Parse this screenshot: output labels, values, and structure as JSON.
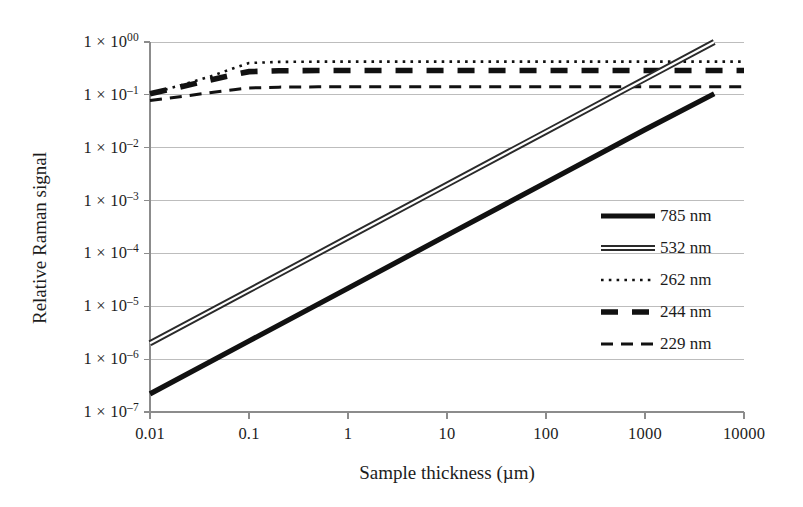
{
  "figure": {
    "background_color": "#ffffff",
    "axis_color": "#8c8c8c",
    "grid_color": "#bdbdbd",
    "text_color": "#1c1c1c"
  },
  "chart_data": {
    "type": "line",
    "title": "",
    "xlabel": "Sample thickness (µm)",
    "ylabel": "Relative Raman signal",
    "xscale": "log",
    "yscale": "log",
    "xlim": [
      0.01,
      10000
    ],
    "ylim": [
      1e-07,
      1
    ],
    "grid": true,
    "legend_position": "right-inside",
    "xticks": [
      0.01,
      0.1,
      1,
      10,
      100,
      1000,
      10000
    ],
    "xticklabels": [
      "0.01",
      "0.1",
      "1",
      "10",
      "100",
      "1000",
      "10000"
    ],
    "yticks": [
      1,
      0.1,
      0.01,
      0.001,
      0.0001,
      1e-05,
      1e-06,
      1e-07
    ],
    "yticklabels": [
      {
        "mantissa": "1 × 10",
        "exponent": "00"
      },
      {
        "mantissa": "1 × 10",
        "exponent": "–1"
      },
      {
        "mantissa": "1 × 10",
        "exponent": "–2"
      },
      {
        "mantissa": "1 × 10",
        "exponent": "–3"
      },
      {
        "mantissa": "1 × 10",
        "exponent": "–4"
      },
      {
        "mantissa": "1 × 10",
        "exponent": "–5"
      },
      {
        "mantissa": "1 × 10",
        "exponent": "–6"
      },
      {
        "mantissa": "1 × 10",
        "exponent": "–7"
      }
    ],
    "series": [
      {
        "name": "785 nm",
        "style": "solid-thick",
        "color": "#111111",
        "x": [
          0.01,
          0.1,
          1,
          10,
          100,
          1000,
          5000
        ],
        "y": [
          2.2e-07,
          2.2e-06,
          2.2e-05,
          0.00022,
          0.0022,
          0.022,
          0.105
        ]
      },
      {
        "name": "532 nm",
        "style": "double-line",
        "color": "#2a2a2a",
        "x": [
          0.01,
          0.1,
          1,
          10,
          100,
          1000,
          5000
        ],
        "y": [
          2e-06,
          2e-05,
          0.0002,
          0.002,
          0.02,
          0.2,
          1.0
        ]
      },
      {
        "name": "262 nm",
        "style": "dotted",
        "color": "#111111",
        "x": [
          0.01,
          0.02,
          0.04,
          0.07,
          0.1,
          0.2,
          0.5,
          1,
          10,
          100,
          1000,
          10000
        ],
        "y": [
          0.105,
          0.15,
          0.22,
          0.32,
          0.4,
          0.42,
          0.425,
          0.425,
          0.425,
          0.425,
          0.425,
          0.425
        ]
      },
      {
        "name": "244 nm",
        "style": "long-dash-thick",
        "color": "#111111",
        "x": [
          0.01,
          0.02,
          0.04,
          0.07,
          0.1,
          0.2,
          0.5,
          1,
          10,
          100,
          1000,
          10000
        ],
        "y": [
          0.105,
          0.14,
          0.19,
          0.24,
          0.275,
          0.285,
          0.288,
          0.288,
          0.288,
          0.288,
          0.288,
          0.288
        ]
      },
      {
        "name": "229 nm",
        "style": "dashed",
        "color": "#111111",
        "x": [
          0.01,
          0.02,
          0.04,
          0.07,
          0.1,
          0.2,
          0.5,
          1,
          10,
          100,
          1000,
          10000
        ],
        "y": [
          0.078,
          0.092,
          0.11,
          0.125,
          0.135,
          0.14,
          0.142,
          0.142,
          0.142,
          0.142,
          0.142,
          0.142
        ]
      }
    ]
  },
  "legend": {
    "entries": [
      {
        "label": "785 nm",
        "style": "solid-thick"
      },
      {
        "label": "532 nm",
        "style": "double-line"
      },
      {
        "label": "262 nm",
        "style": "dotted"
      },
      {
        "label": "244 nm",
        "style": "long-dash-thick"
      },
      {
        "label": "229 nm",
        "style": "dashed"
      }
    ]
  }
}
